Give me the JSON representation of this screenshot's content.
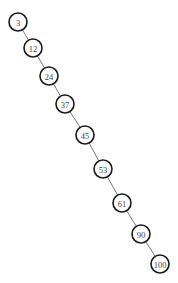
{
  "diagram": {
    "type": "binary-search-tree",
    "node_radius": 9,
    "nodes": [
      {
        "id": "n3",
        "label": "3",
        "x": 18,
        "y": 22
      },
      {
        "id": "n12",
        "label": "12",
        "x": 33,
        "y": 48
      },
      {
        "id": "n24",
        "label": "24",
        "x": 49,
        "y": 76
      },
      {
        "id": "n37",
        "label": "37",
        "x": 65,
        "y": 104
      },
      {
        "id": "n45",
        "label": "45",
        "x": 85,
        "y": 135
      },
      {
        "id": "n53",
        "label": "53",
        "x": 103,
        "y": 169
      },
      {
        "id": "n61",
        "label": "61",
        "x": 122,
        "y": 203
      },
      {
        "id": "n90",
        "label": "90",
        "x": 141,
        "y": 234
      },
      {
        "id": "n100",
        "label": "100",
        "x": 160,
        "y": 264
      }
    ],
    "edges": [
      {
        "from": "n3",
        "to": "n12"
      },
      {
        "from": "n12",
        "to": "n24"
      },
      {
        "from": "n24",
        "to": "n37"
      },
      {
        "from": "n37",
        "to": "n45"
      },
      {
        "from": "n45",
        "to": "n53"
      },
      {
        "from": "n53",
        "to": "n61"
      },
      {
        "from": "n61",
        "to": "n90"
      },
      {
        "from": "n90",
        "to": "n100"
      }
    ],
    "colors": {
      "node_stroke": "#1a1a1a",
      "node_fill": "#ffffff",
      "edge": "#6a6a6a",
      "label": "#444444",
      "background": "#ffffff"
    }
  }
}
